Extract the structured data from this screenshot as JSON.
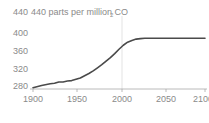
{
  "chart_data": {
    "type": "line",
    "title": "440 parts per million CO",
    "title_subscript": "2",
    "title_full": "440 parts per million CO2",
    "xlabel": "",
    "ylabel": "",
    "xlim": [
      1900,
      2100
    ],
    "ylim": [
      276,
      440
    ],
    "xticks": [
      1900,
      1950,
      2000,
      2050,
      2100
    ],
    "xtick_labels": [
      "1900",
      "1950",
      "2000",
      "2050",
      "2100"
    ],
    "yticks": [
      280,
      320,
      360,
      400,
      440
    ],
    "ytick_labels": [
      "280",
      "320",
      "360",
      "400",
      "440"
    ],
    "grid": false,
    "legend": "none",
    "annotations": [
      {
        "name": "year-2000-gridline",
        "type": "vline",
        "x": 2000
      }
    ],
    "colors": {
      "line": "#4a4a4a",
      "text": "#8a8a8a",
      "axis": "#9a9a9a",
      "gridline": "#d8d8d8",
      "background": "#ffffff"
    },
    "series": [
      {
        "name": "CO2 concentration",
        "x": [
          1900,
          1910,
          1920,
          1925,
          1930,
          1935,
          1940,
          1945,
          1950,
          1955,
          1960,
          1965,
          1970,
          1975,
          1980,
          1985,
          1990,
          1995,
          2000,
          2005,
          2010,
          2015,
          2020,
          2025,
          2030,
          2035,
          2040,
          2050,
          2060,
          2070,
          2080,
          2090,
          2100
        ],
        "values": [
          283,
          288,
          292,
          293,
          296,
          296,
          298,
          299,
          302,
          305,
          310,
          315,
          321,
          328,
          335,
          343,
          351,
          360,
          370,
          379,
          386,
          390,
          393,
          394,
          395,
          395,
          395,
          395,
          395,
          395,
          395,
          395,
          395
        ]
      }
    ]
  }
}
